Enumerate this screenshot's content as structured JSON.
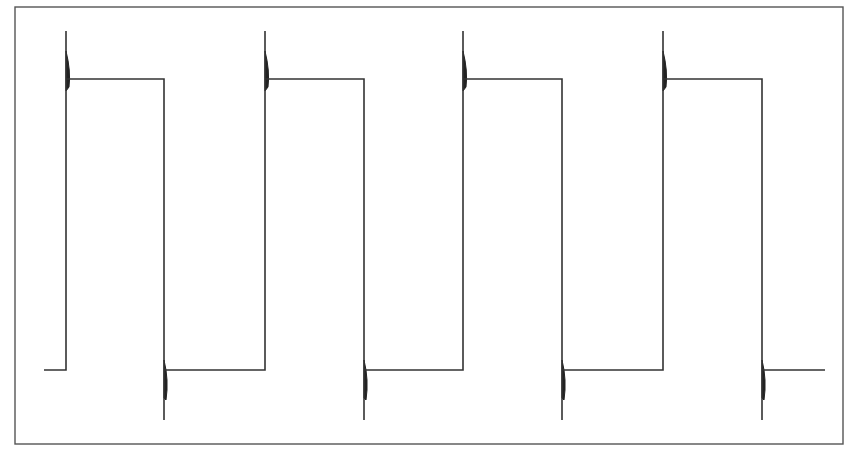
{
  "chart_data": {
    "type": "line",
    "title": "",
    "xlabel": "",
    "ylabel": "",
    "grid": false,
    "legend": null,
    "frame": {
      "left": 15,
      "top": 7,
      "right": 843,
      "bottom": 444
    },
    "levels": {
      "low": 370,
      "high": 79,
      "overshoot_peak": 31,
      "undershoot_peak": 420
    },
    "segments": [
      {
        "type": "low",
        "x_start": 44,
        "x_end": 66
      },
      {
        "type": "rise",
        "x": 66
      },
      {
        "type": "high",
        "x_start": 66,
        "x_end": 164
      },
      {
        "type": "fall",
        "x": 164
      },
      {
        "type": "low",
        "x_start": 164,
        "x_end": 265
      },
      {
        "type": "rise",
        "x": 265
      },
      {
        "type": "high",
        "x_start": 265,
        "x_end": 364
      },
      {
        "type": "fall",
        "x": 364
      },
      {
        "type": "low",
        "x_start": 364,
        "x_end": 463
      },
      {
        "type": "rise",
        "x": 463
      },
      {
        "type": "high",
        "x_start": 463,
        "x_end": 562
      },
      {
        "type": "fall",
        "x": 562
      },
      {
        "type": "low",
        "x_start": 562,
        "x_end": 663
      },
      {
        "type": "rise",
        "x": 663
      },
      {
        "type": "high",
        "x_start": 663,
        "x_end": 762
      },
      {
        "type": "fall",
        "x": 762
      },
      {
        "type": "low",
        "x_start": 762,
        "x_end": 825
      }
    ],
    "rising_edges_x": [
      66,
      265,
      463,
      663
    ],
    "falling_edges_x": [
      164,
      364,
      562,
      762
    ],
    "x_start": 44,
    "x_end": 825,
    "cycles": 4,
    "colors": {
      "wave": "#333333",
      "frame": "#555555",
      "background": "#ffffff"
    }
  }
}
